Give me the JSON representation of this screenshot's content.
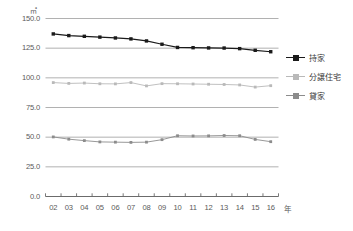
{
  "chart_data": {
    "type": "line",
    "title": "",
    "unit_label": "㎡",
    "xlabel": "年",
    "ylabel": "",
    "grid": true,
    "legend_position": "right",
    "ylim": [
      0.0,
      150.0
    ],
    "yticks": [
      "0.0",
      "25.0",
      "50.0",
      "75.0",
      "100.0",
      "125.0",
      "150.0"
    ],
    "ytick_values": [
      0.0,
      25.0,
      50.0,
      75.0,
      100.0,
      125.0,
      150.0
    ],
    "categories": [
      "02",
      "03",
      "04",
      "05",
      "06",
      "07",
      "08",
      "09",
      "10",
      "11",
      "12",
      "13",
      "14",
      "15",
      "16"
    ],
    "series": [
      {
        "name": "持家",
        "color": "#1a1a1a",
        "marker": "square",
        "values": [
          137.0,
          135.6,
          135.0,
          134.3,
          133.6,
          132.8,
          131.1,
          128.3,
          125.6,
          125.4,
          125.2,
          125.1,
          124.6,
          123.2,
          122.0
        ]
      },
      {
        "name": "分譲住宅",
        "color": "#b9b9b9",
        "marker": "square",
        "values": [
          96.0,
          95.3,
          95.6,
          95.0,
          94.9,
          96.0,
          93.2,
          95.1,
          95.0,
          94.8,
          94.6,
          94.4,
          94.0,
          92.2,
          93.4
        ]
      },
      {
        "name": "貸家",
        "color": "#8c8c8c",
        "marker": "square",
        "values": [
          50.2,
          48.3,
          47.1,
          46.0,
          45.8,
          45.6,
          45.8,
          47.9,
          51.2,
          51.0,
          51.1,
          51.4,
          51.2,
          48.1,
          46.2
        ]
      }
    ]
  }
}
